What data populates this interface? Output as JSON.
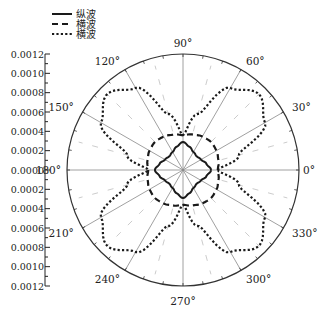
{
  "chart_data": {
    "type": "polar-line",
    "title": "",
    "legend": {
      "position": "top-left",
      "entries": [
        {
          "label": "纵波",
          "style": "solid"
        },
        {
          "label": "横波",
          "style": "dashed"
        },
        {
          "label": "横波",
          "style": "dotted"
        }
      ]
    },
    "radial_axis": {
      "range": [
        0,
        0.0012
      ],
      "ticks": [
        "0.0012",
        "0.0010",
        "0.0008",
        "0.0006",
        "0.0004",
        "0.0002",
        "0.0000",
        "0.0002",
        "0.0004",
        "0.0006",
        "0.0008",
        "0.0010",
        "0.0012"
      ],
      "tick_values": [
        0.0012,
        0.001,
        0.0008,
        0.0006,
        0.0004,
        0.0002,
        0.0,
        0.0002,
        0.0004,
        0.0006,
        0.0008,
        0.001,
        0.0012
      ]
    },
    "angular_axis": {
      "unit": "degrees",
      "ticks": [
        0,
        30,
        60,
        90,
        120,
        150,
        180,
        210,
        240,
        270,
        300,
        330
      ],
      "tick_labels": [
        "0°",
        "30°",
        "60°",
        "90°",
        "120°",
        "150°",
        "180°",
        "210°",
        "240°",
        "270°",
        "300°",
        "330°"
      ]
    },
    "grid": true,
    "series": [
      {
        "name": "纵波",
        "style": "solid",
        "shape": "rounded diamond, max on 0/90/180/270 axes",
        "angles": [
          0,
          15,
          30,
          45,
          60,
          75,
          90,
          105,
          120,
          135,
          150,
          165,
          180,
          195,
          210,
          225,
          240,
          255,
          270,
          285,
          300,
          315,
          330,
          345
        ],
        "values": [
          0.00029,
          0.00025,
          0.000215,
          0.0002,
          0.000215,
          0.00025,
          0.00029,
          0.00025,
          0.000215,
          0.0002,
          0.000215,
          0.00025,
          0.00029,
          0.00025,
          0.000215,
          0.0002,
          0.000215,
          0.00025,
          0.00029,
          0.00025,
          0.000215,
          0.0002,
          0.000215,
          0.00025
        ]
      },
      {
        "name": "横波",
        "style": "dashed",
        "shape": "near-circular, slight lobes",
        "angles": [
          0,
          15,
          30,
          45,
          60,
          75,
          90,
          105,
          120,
          135,
          150,
          165,
          180,
          195,
          210,
          225,
          240,
          255,
          270,
          285,
          300,
          315,
          330,
          345
        ],
        "values": [
          0.00036,
          0.00038,
          0.0004,
          0.00041,
          0.0004,
          0.00038,
          0.00036,
          0.00038,
          0.0004,
          0.00041,
          0.0004,
          0.00038,
          0.00036,
          0.00038,
          0.0004,
          0.00041,
          0.0004,
          0.00038,
          0.00036,
          0.00038,
          0.0004,
          0.00041,
          0.0004,
          0.00038
        ]
      },
      {
        "name": "横波",
        "style": "dotted",
        "shape": "four lobes at 45/135/225/315",
        "angles": [
          0,
          15,
          30,
          45,
          60,
          75,
          90,
          105,
          120,
          135,
          150,
          165,
          180,
          195,
          210,
          225,
          240,
          255,
          270,
          285,
          300,
          315,
          330,
          345
        ],
        "values": [
          0.00036,
          0.0006,
          0.00098,
          0.00111,
          0.00098,
          0.0006,
          0.00036,
          0.0006,
          0.00098,
          0.00111,
          0.00098,
          0.0006,
          0.00036,
          0.0006,
          0.00098,
          0.00111,
          0.00098,
          0.0006,
          0.00036,
          0.0006,
          0.00098,
          0.00111,
          0.00098,
          0.0006
        ]
      }
    ]
  },
  "colors": {
    "line": "#1a1a1a",
    "grid": "#888888",
    "minor_grid": "#cccccc"
  }
}
